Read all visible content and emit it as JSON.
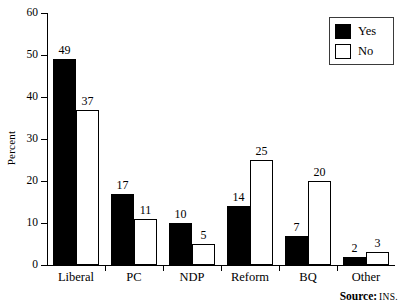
{
  "chart_data": {
    "type": "bar",
    "title": "",
    "subtitle": "",
    "xlabel": "",
    "ylabel": "Percent",
    "ylim": [
      0,
      60
    ],
    "yticks": [
      0,
      10,
      20,
      30,
      40,
      50,
      60
    ],
    "grid": false,
    "categories": [
      "Liberal",
      "PC",
      "NDP",
      "Reform",
      "BQ",
      "Other"
    ],
    "series": [
      {
        "name": "Yes",
        "color": "#000000",
        "values": [
          49,
          17,
          10,
          14,
          7,
          2
        ]
      },
      {
        "name": "No",
        "color": "#ffffff",
        "values": [
          37,
          11,
          5,
          25,
          20,
          3
        ]
      }
    ],
    "legend_position": "top-right",
    "data_labels": true,
    "annotations": []
  },
  "legend": {
    "entries": [
      {
        "label": "Yes",
        "swatch": "filled-black-square"
      },
      {
        "label": "No",
        "swatch": "empty-white-square"
      }
    ]
  },
  "source": {
    "key": "Source:",
    "value": "INS."
  },
  "colors": {
    "yes_fill": "#000000",
    "no_fill": "#ffffff",
    "stroke": "#000000",
    "background": "#ffffff"
  }
}
